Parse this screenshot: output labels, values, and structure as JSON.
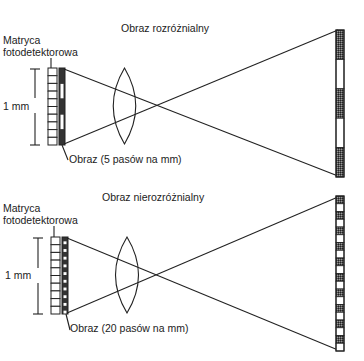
{
  "colors": {
    "ink": "#222222",
    "dark_band": "#3a3a3a",
    "light_band": "#ffffff",
    "background": "#ffffff"
  },
  "panels": [
    {
      "id": "resolvable",
      "title": "Obraz rozróżnialny",
      "detector_label_line1": "Matryca",
      "detector_label_line2": "fotodetektorowa",
      "scale_label": "1 mm",
      "image_label": "Obraz (5 pasów na mm)",
      "detector_cells": 10,
      "target_bands": 5,
      "image_line_pairs_per_mm": 5
    },
    {
      "id": "unresolvable",
      "title": "Obraz nierozróżnialny",
      "detector_label_line1": "Matryca",
      "detector_label_line2": "fotodetektorowa",
      "scale_label": "1 mm",
      "image_label": "Obraz (20 pasów na mm)",
      "detector_cells": 10,
      "target_bands": 20,
      "image_line_pairs_per_mm": 20
    }
  ]
}
